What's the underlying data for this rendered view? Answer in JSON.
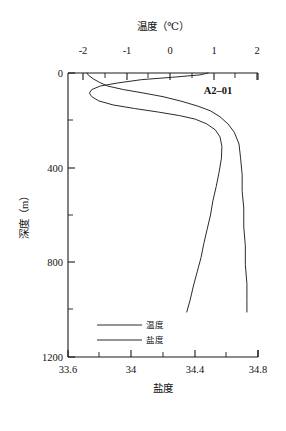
{
  "chart_data": {
    "type": "line",
    "title": "",
    "annotations": [
      {
        "text": "A2–01",
        "x_px": 218,
        "y_px": 90,
        "name": "station-label"
      }
    ],
    "axes": {
      "top": {
        "name": "temperature-axis",
        "label": "温度（℃）",
        "unit": "℃",
        "ticks": [
          "-2",
          "-1",
          "0",
          "1",
          "2"
        ],
        "tick_values": [
          -2,
          -1,
          0,
          1,
          2
        ],
        "minor_ticks": [
          -1.5,
          -0.5,
          0.5,
          1.5
        ],
        "range": [
          -2,
          2
        ],
        "position": "top"
      },
      "bottom": {
        "name": "salinity-axis",
        "label": "盐度",
        "ticks": [
          "33.6",
          "34",
          "34.4",
          "34.8"
        ],
        "tick_values": [
          33.6,
          34.0,
          34.4,
          34.8
        ],
        "minor_ticks": [
          33.8,
          34.2,
          34.6
        ],
        "range": [
          33.6,
          34.8
        ],
        "position": "bottom"
      },
      "left": {
        "name": "depth-axis",
        "label": "深度（m）",
        "unit": "m",
        "ticks": [
          "0",
          "400",
          "800",
          "1200"
        ],
        "tick_values": [
          0,
          400,
          800,
          1200
        ],
        "minor_ticks": [
          200,
          600,
          1000
        ],
        "range": [
          0,
          1200
        ],
        "position": "left",
        "inverted": true
      }
    },
    "grid": false,
    "legend": {
      "position": "bottom-left-inside",
      "entries": [
        {
          "name": "legend-temperature",
          "label": "温度",
          "color": "#2b2b2b"
        },
        {
          "name": "legend-salinity",
          "label": "盐度",
          "color": "#2b2b2b"
        }
      ]
    },
    "series": [
      {
        "name": "temperature",
        "label": "温度",
        "axis": "top",
        "color": "#2b2b2b",
        "points": [
          {
            "depth": 0,
            "value": 0.95
          },
          {
            "depth": 8,
            "value": 0.78
          },
          {
            "depth": 18,
            "value": 0.2
          },
          {
            "depth": 28,
            "value": -0.45
          },
          {
            "depth": 42,
            "value": -0.95
          },
          {
            "depth": 55,
            "value": -1.32
          },
          {
            "depth": 70,
            "value": -1.5
          },
          {
            "depth": 85,
            "value": -1.55
          },
          {
            "depth": 100,
            "value": -1.5
          },
          {
            "depth": 118,
            "value": -1.35
          },
          {
            "depth": 135,
            "value": -1.05
          },
          {
            "depth": 150,
            "value": -0.6
          },
          {
            "depth": 165,
            "value": -0.1
          },
          {
            "depth": 180,
            "value": 0.35
          },
          {
            "depth": 195,
            "value": 0.68
          },
          {
            "depth": 215,
            "value": 0.92
          },
          {
            "depth": 240,
            "value": 1.1
          },
          {
            "depth": 270,
            "value": 1.2
          },
          {
            "depth": 310,
            "value": 1.24
          },
          {
            "depth": 360,
            "value": 1.23
          },
          {
            "depth": 420,
            "value": 1.18
          },
          {
            "depth": 480,
            "value": 1.12
          },
          {
            "depth": 540,
            "value": 1.05
          },
          {
            "depth": 600,
            "value": 1.0
          },
          {
            "depth": 660,
            "value": 0.93
          },
          {
            "depth": 720,
            "value": 0.86
          },
          {
            "depth": 780,
            "value": 0.8
          },
          {
            "depth": 840,
            "value": 0.72
          },
          {
            "depth": 900,
            "value": 0.64
          },
          {
            "depth": 960,
            "value": 0.57
          },
          {
            "depth": 1010,
            "value": 0.5
          }
        ]
      },
      {
        "name": "salinity",
        "label": "盐度",
        "axis": "bottom",
        "color": "#2b2b2b",
        "points": [
          {
            "depth": 0,
            "value": 33.72
          },
          {
            "depth": 10,
            "value": 33.73
          },
          {
            "depth": 25,
            "value": 33.76
          },
          {
            "depth": 40,
            "value": 33.8
          },
          {
            "depth": 55,
            "value": 33.85
          },
          {
            "depth": 70,
            "value": 33.95
          },
          {
            "depth": 85,
            "value": 34.08
          },
          {
            "depth": 100,
            "value": 34.2
          },
          {
            "depth": 120,
            "value": 34.32
          },
          {
            "depth": 140,
            "value": 34.42
          },
          {
            "depth": 160,
            "value": 34.5
          },
          {
            "depth": 185,
            "value": 34.56
          },
          {
            "depth": 215,
            "value": 34.61
          },
          {
            "depth": 250,
            "value": 34.65
          },
          {
            "depth": 300,
            "value": 34.68
          },
          {
            "depth": 360,
            "value": 34.69
          },
          {
            "depth": 430,
            "value": 34.7
          },
          {
            "depth": 500,
            "value": 34.7
          },
          {
            "depth": 570,
            "value": 34.71
          },
          {
            "depth": 650,
            "value": 34.71
          },
          {
            "depth": 730,
            "value": 34.72
          },
          {
            "depth": 810,
            "value": 34.72
          },
          {
            "depth": 890,
            "value": 34.73
          },
          {
            "depth": 960,
            "value": 34.73
          },
          {
            "depth": 1010,
            "value": 34.73
          }
        ]
      }
    ]
  }
}
